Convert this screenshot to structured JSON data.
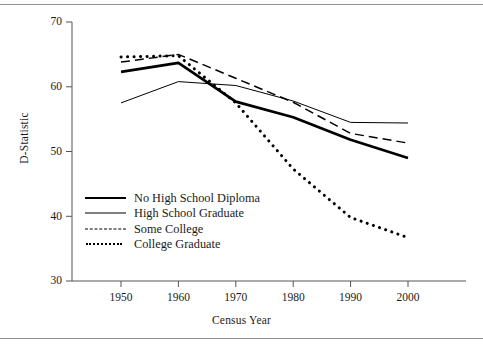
{
  "figure": {
    "background_color": "#ffffff",
    "line_color": "#000000",
    "axis_color": "#555555"
  },
  "axes": {
    "y_label": "D-Statistic",
    "x_label": "Census Year",
    "y_ticks": [
      "70",
      "60",
      "50",
      "40",
      "30"
    ],
    "x_ticks": [
      "1950",
      "1960",
      "1970",
      "1980",
      "1990",
      "2000"
    ]
  },
  "legend": {
    "items": [
      {
        "label": "No High School Diploma",
        "style": "thick-solid"
      },
      {
        "label": "High School Graduate",
        "style": "thin-solid"
      },
      {
        "label": "Some College",
        "style": "dashed"
      },
      {
        "label": "College Graduate",
        "style": "dotted"
      }
    ]
  },
  "chart_data": {
    "type": "line",
    "title": "",
    "xlabel": "Census Year",
    "ylabel": "D-Statistic",
    "x": [
      1950,
      1960,
      1970,
      1980,
      1990,
      2000
    ],
    "xlim": [
      1945,
      2005
    ],
    "ylim": [
      30,
      70
    ],
    "y_ticks": [
      30,
      40,
      50,
      60,
      70
    ],
    "x_ticks": [
      1950,
      1960,
      1970,
      1980,
      1990,
      2000
    ],
    "grid": false,
    "legend_position": "lower-left inside axes",
    "series": [
      {
        "name": "No High School Diploma",
        "style": "thick-solid",
        "values": [
          62.3,
          63.7,
          57.7,
          55.3,
          51.8,
          49.0
        ]
      },
      {
        "name": "High School Graduate",
        "style": "thin-solid",
        "values": [
          57.5,
          60.8,
          60.2,
          57.8,
          54.5,
          54.4
        ]
      },
      {
        "name": "Some College",
        "style": "dashed",
        "values": [
          63.8,
          65.0,
          61.3,
          57.6,
          52.8,
          51.3
        ]
      },
      {
        "name": "College Graduate",
        "style": "dotted",
        "values": [
          64.6,
          64.8,
          57.5,
          47.3,
          39.8,
          36.7
        ]
      }
    ]
  }
}
